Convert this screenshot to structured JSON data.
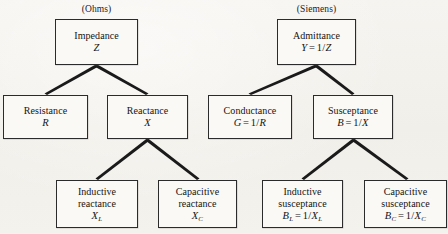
{
  "diagram": {
    "background_color": "#f4f2ee",
    "box_border_color": "#2b2b2b",
    "text_color": "#141414",
    "connector_color": "#1a1a1a",
    "groups": [
      {
        "id": "ohms",
        "label": "(Ohms)"
      },
      {
        "id": "siemens",
        "label": "(Siemens)"
      }
    ],
    "nodes": [
      {
        "id": "impedance",
        "name": "Impedance",
        "symbol": "Z",
        "symbol_html": "Z",
        "x": 55,
        "y": 19,
        "w": 83,
        "h": 46
      },
      {
        "id": "resistance",
        "name": "Resistance",
        "symbol": "R",
        "symbol_html": "R",
        "x": 3,
        "y": 95,
        "w": 85,
        "h": 44
      },
      {
        "id": "reactance",
        "name": "Reactance",
        "symbol": "X",
        "symbol_html": "X",
        "x": 107,
        "y": 95,
        "w": 81,
        "h": 44
      },
      {
        "id": "inductive-reactance",
        "name_line1": "Inductive",
        "name_line2": "reactance",
        "symbol": "X_L",
        "symbol_html": "X<sub>L</sub>",
        "x": 56,
        "y": 180,
        "w": 82,
        "h": 48
      },
      {
        "id": "capacitive-reactance",
        "name_line1": "Capacitive",
        "name_line2": "reactance",
        "symbol": "X_C",
        "symbol_html": "X<sub>C</sub>",
        "x": 158,
        "y": 180,
        "w": 79,
        "h": 48
      },
      {
        "id": "admittance",
        "name": "Admittance",
        "symbol": "Y = 1/Z",
        "symbol_html": "Y<span class=\"op\">=</span><span class=\"num\">1/</span>Z",
        "x": 277,
        "y": 19,
        "w": 79,
        "h": 46
      },
      {
        "id": "conductance",
        "name": "Conductance",
        "symbol": "G = 1/R",
        "symbol_html": "G<span class=\"op\">=</span><span class=\"num\">1/</span>R",
        "x": 208,
        "y": 95,
        "w": 84,
        "h": 44
      },
      {
        "id": "susceptance",
        "name": "Susceptance",
        "symbol": "B = 1/X",
        "symbol_html": "B<span class=\"op\">=</span><span class=\"num\">1/</span>X",
        "x": 313,
        "y": 95,
        "w": 80,
        "h": 44
      },
      {
        "id": "inductive-susceptance",
        "name_line1": "Inductive",
        "name_line2": "susceptance",
        "symbol": "B_L = 1/X_L",
        "symbol_html": "B<sub>L</sub><span class=\"op\">=</span><span class=\"num\">1/</span>X<sub>L</sub>",
        "x": 262,
        "y": 180,
        "w": 81,
        "h": 48
      },
      {
        "id": "capacitive-susceptance",
        "name_line1": "Capacitive",
        "name_line2": "susceptance",
        "symbol": "B_C = 1/X_C",
        "symbol_html": "B<sub>C</sub><span class=\"op\">=</span><span class=\"num\">1/</span>X<sub>C</sub>",
        "x": 364,
        "y": 180,
        "w": 83,
        "h": 48
      }
    ],
    "edges": [
      {
        "from": "impedance",
        "to": "resistance"
      },
      {
        "from": "impedance",
        "to": "reactance"
      },
      {
        "from": "reactance",
        "to": "inductive-reactance"
      },
      {
        "from": "reactance",
        "to": "capacitive-reactance"
      },
      {
        "from": "admittance",
        "to": "conductance"
      },
      {
        "from": "admittance",
        "to": "susceptance"
      },
      {
        "from": "susceptance",
        "to": "inductive-susceptance"
      },
      {
        "from": "susceptance",
        "to": "capacitive-susceptance"
      }
    ]
  }
}
